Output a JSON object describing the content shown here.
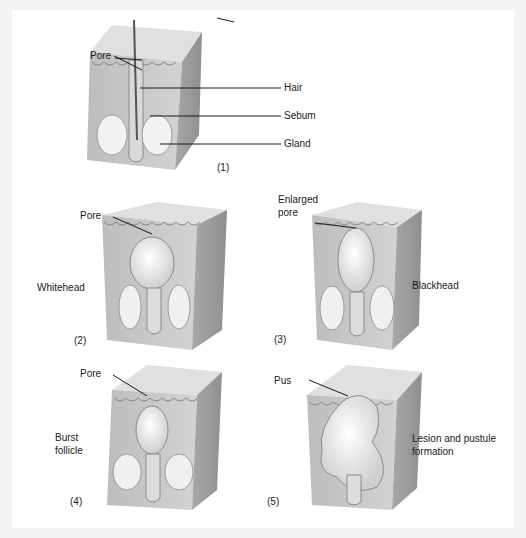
{
  "figure": {
    "panels": [
      {
        "number": "(1)",
        "labels": [
          "Pore",
          "Hair",
          "Sebum",
          "Gland"
        ]
      },
      {
        "number": "(2)",
        "caption": "Whitehead",
        "labels": [
          "Pore"
        ]
      },
      {
        "number": "(3)",
        "caption": "Blackhead",
        "labels": [
          "Enlarged",
          "pore"
        ]
      },
      {
        "number": "(4)",
        "caption_lines": [
          "Burst",
          "follicle"
        ],
        "labels": [
          "Pore"
        ]
      },
      {
        "number": "(5)",
        "caption_lines": [
          "Lesion and pustule",
          "formation"
        ],
        "labels": [
          "Pus"
        ]
      }
    ]
  },
  "colors": {
    "background": "#f4f4f4",
    "sheet": "#ffffff",
    "skin_front": "#c9c9c9",
    "skin_top": "#e2e2e2",
    "skin_side": "#a9a9a9",
    "gland": "#f2f2f2",
    "line": "#1a1a1a"
  }
}
